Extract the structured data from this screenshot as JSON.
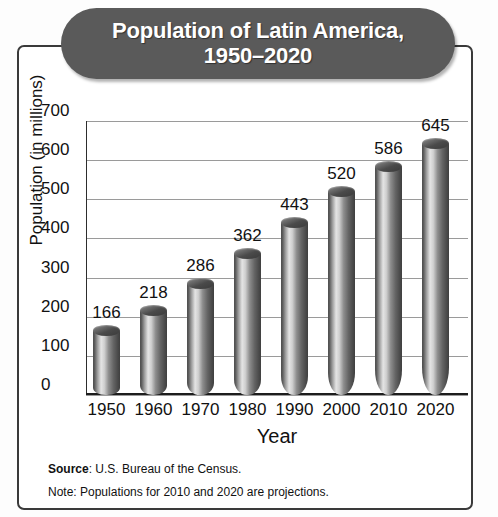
{
  "chart_data": {
    "type": "bar",
    "title": "Population of Latin America,\n1950–2020",
    "title_line1": "Population of Latin America,",
    "title_line2": "1950–2020",
    "xlabel": "Year",
    "ylabel": "Population (in millions)",
    "categories": [
      "1950",
      "1960",
      "1970",
      "1980",
      "1990",
      "2000",
      "2010",
      "2020"
    ],
    "values": [
      166,
      218,
      286,
      362,
      443,
      520,
      586,
      645
    ],
    "ylim": [
      0,
      700
    ],
    "ytick_labels": [
      "0",
      "100",
      "200",
      "300",
      "400",
      "500",
      "600",
      "700"
    ],
    "ytick_values": [
      0,
      100,
      200,
      300,
      400,
      500,
      600,
      700
    ],
    "grid": true,
    "legend": "none",
    "bar_style": "3d-cylinder",
    "colors": {
      "title_pill": "#5a5a5a",
      "title_text": "#ffffff",
      "frame_border": "#3a3a3a",
      "gridline": "#9a9a9a",
      "axis": "#1d1d1d",
      "text": "#111111",
      "background": "#ffffff"
    }
  },
  "footnotes": {
    "source_label": "Source",
    "source_text": ": U.S. Bureau of the Census.",
    "note_text": "Note: Populations for 2010 and 2020 are projections."
  }
}
